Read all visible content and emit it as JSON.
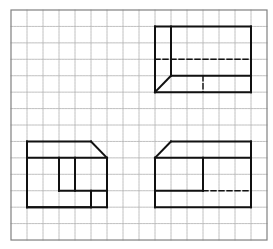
{
  "diagram": {
    "type": "orthographic-projection-views-on-grid",
    "grid": {
      "x0": 11,
      "y0": 10,
      "cols": 16,
      "rows": 14,
      "cell_w": 16,
      "cell_h": 16.43,
      "line_color": "#b0b0b0",
      "border_color": "#808080"
    },
    "line_color": "#111111",
    "views": [
      {
        "name": "top-right-view",
        "solid": [
          [
            9,
            1,
            15,
            1
          ],
          [
            15,
            1,
            15,
            5
          ],
          [
            15,
            5,
            9,
            5
          ],
          [
            9,
            5,
            9,
            1
          ],
          [
            10,
            1,
            10,
            4
          ],
          [
            10,
            4,
            15,
            4
          ],
          [
            10,
            4,
            9,
            5
          ]
        ],
        "dashed": [
          [
            9,
            3,
            15,
            3
          ],
          [
            12,
            4,
            12,
            5
          ]
        ]
      },
      {
        "name": "bottom-left-view",
        "solid": [
          [
            1,
            8,
            5,
            8
          ],
          [
            5,
            8,
            6,
            9
          ],
          [
            1,
            9,
            6,
            9
          ],
          [
            1,
            8,
            1,
            12
          ],
          [
            1,
            12,
            5,
            12
          ],
          [
            5,
            12,
            5,
            11
          ],
          [
            6,
            9,
            6,
            12
          ],
          [
            1,
            12,
            6,
            12
          ],
          [
            3,
            9,
            3,
            11
          ],
          [
            4,
            9,
            4,
            11
          ],
          [
            3,
            11,
            6,
            11
          ]
        ],
        "dashed": []
      },
      {
        "name": "bottom-right-view",
        "solid": [
          [
            10,
            8,
            15,
            8
          ],
          [
            15,
            8,
            15,
            12
          ],
          [
            9,
            12,
            15,
            12
          ],
          [
            9,
            9,
            9,
            12
          ],
          [
            9,
            9,
            10,
            8
          ],
          [
            9,
            9,
            15,
            9
          ],
          [
            12,
            9,
            12,
            11
          ],
          [
            9,
            11,
            12,
            11
          ]
        ],
        "dashed": [
          [
            12,
            11,
            15,
            11
          ]
        ]
      }
    ]
  }
}
